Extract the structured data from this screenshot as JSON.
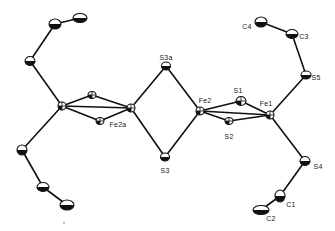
{
  "figure": {
    "type": "ORTEP molecular structure diagram",
    "colors": {
      "ink": "#111111",
      "background": "#ffffff"
    }
  },
  "labels": [
    {
      "id": "S3a",
      "text": "S3a",
      "x": 166,
      "y": 57
    },
    {
      "id": "S3",
      "text": "S3",
      "x": 165,
      "y": 170
    },
    {
      "id": "Fe2a",
      "text": "Fe2a",
      "x": 118,
      "y": 124
    },
    {
      "id": "Fe2",
      "text": "Fe2",
      "x": 205,
      "y": 100
    },
    {
      "id": "S1",
      "text": "S1",
      "x": 238,
      "y": 90
    },
    {
      "id": "S2",
      "text": "S2",
      "x": 229,
      "y": 136
    },
    {
      "id": "Fe1",
      "text": "Fe1",
      "x": 266,
      "y": 103
    },
    {
      "id": "S5",
      "text": "S5",
      "x": 316,
      "y": 77
    },
    {
      "id": "C3",
      "text": "C3",
      "x": 304,
      "y": 36
    },
    {
      "id": "C4",
      "text": "C4",
      "x": 247,
      "y": 26
    },
    {
      "id": "S4",
      "text": "S4",
      "x": 318,
      "y": 166
    },
    {
      "id": "C1",
      "text": "C1",
      "x": 291,
      "y": 204
    },
    {
      "id": "C2",
      "text": "C2",
      "x": 271,
      "y": 218
    }
  ],
  "atoms": [
    {
      "id": "Fe1a",
      "x": 62,
      "y": 106,
      "rx": 4,
      "ry": 4,
      "style": "quadrant"
    },
    {
      "id": "S1a",
      "x": 92,
      "y": 95,
      "rx": 4,
      "ry": 3.5,
      "style": "quadrant"
    },
    {
      "id": "S2a",
      "x": 100,
      "y": 121,
      "rx": 4,
      "ry": 3.5,
      "style": "quadrant"
    },
    {
      "id": "Fe2a",
      "x": 131,
      "y": 108,
      "rx": 4,
      "ry": 4,
      "style": "quadrant"
    },
    {
      "id": "S3a",
      "x": 166,
      "y": 66,
      "rx": 4.5,
      "ry": 4,
      "style": "half"
    },
    {
      "id": "S3",
      "x": 165,
      "y": 157,
      "rx": 4.5,
      "ry": 4,
      "style": "half"
    },
    {
      "id": "Fe2",
      "x": 200,
      "y": 111,
      "rx": 4,
      "ry": 4,
      "style": "quadrant"
    },
    {
      "id": "S1",
      "x": 241,
      "y": 101,
      "rx": 5,
      "ry": 4.5,
      "style": "quadrant"
    },
    {
      "id": "S2",
      "x": 229,
      "y": 121,
      "rx": 4,
      "ry": 3.5,
      "style": "quadrant"
    },
    {
      "id": "Fe1",
      "x": 270,
      "y": 115,
      "rx": 4,
      "ry": 4,
      "style": "quadrant"
    },
    {
      "id": "S5",
      "x": 306,
      "y": 75,
      "rx": 5,
      "ry": 4,
      "style": "half"
    },
    {
      "id": "C3",
      "x": 292,
      "y": 34,
      "rx": 6,
      "ry": 4.5,
      "style": "half"
    },
    {
      "id": "C4",
      "x": 261,
      "y": 22,
      "rx": 6,
      "ry": 5,
      "style": "half"
    },
    {
      "id": "S4",
      "x": 305,
      "y": 161,
      "rx": 5,
      "ry": 4.5,
      "style": "half"
    },
    {
      "id": "C1",
      "x": 280,
      "y": 196,
      "rx": 5,
      "ry": 6,
      "style": "half"
    },
    {
      "id": "C2",
      "x": 261,
      "y": 210,
      "rx": 8,
      "ry": 4.5,
      "style": "half"
    },
    {
      "id": "S5a",
      "x": 30,
      "y": 61,
      "rx": 5,
      "ry": 4.5,
      "style": "half"
    },
    {
      "id": "C3a",
      "x": 55,
      "y": 24,
      "rx": 6,
      "ry": 5,
      "style": "half"
    },
    {
      "id": "C4a",
      "x": 80,
      "y": 18,
      "rx": 7,
      "ry": 4.5,
      "style": "half"
    },
    {
      "id": "S4a",
      "x": 22,
      "y": 150,
      "rx": 5,
      "ry": 5,
      "style": "half"
    },
    {
      "id": "C1a",
      "x": 43,
      "y": 187,
      "rx": 6,
      "ry": 4.5,
      "style": "half"
    },
    {
      "id": "C2a",
      "x": 67,
      "y": 205,
      "rx": 7,
      "ry": 5,
      "style": "half"
    }
  ],
  "bonds": [
    [
      "Fe1a",
      "S1a"
    ],
    [
      "Fe1a",
      "S2a"
    ],
    [
      "S1a",
      "Fe2a"
    ],
    [
      "S2a",
      "Fe2a"
    ],
    [
      "Fe1a",
      "Fe2a"
    ],
    [
      "Fe2a",
      "S3a"
    ],
    [
      "Fe2a",
      "S3"
    ],
    [
      "S3a",
      "Fe2"
    ],
    [
      "S3",
      "Fe2"
    ],
    [
      "Fe2",
      "S1"
    ],
    [
      "Fe2",
      "S2"
    ],
    [
      "S1",
      "Fe1"
    ],
    [
      "S2",
      "Fe1"
    ],
    [
      "Fe2",
      "Fe1"
    ],
    [
      "Fe1",
      "S5"
    ],
    [
      "S5",
      "C3"
    ],
    [
      "C3",
      "C4"
    ],
    [
      "Fe1",
      "S4"
    ],
    [
      "S4",
      "C1"
    ],
    [
      "C1",
      "C2"
    ],
    [
      "Fe1a",
      "S5a"
    ],
    [
      "S5a",
      "C3a"
    ],
    [
      "C3a",
      "C4a"
    ],
    [
      "Fe1a",
      "S4a"
    ],
    [
      "S4a",
      "C1a"
    ],
    [
      "C1a",
      "C2a"
    ]
  ],
  "stray_mark": {
    "x": 64,
    "y": 223
  }
}
